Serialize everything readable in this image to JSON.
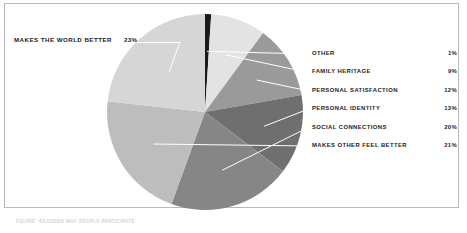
{
  "chart_data": {
    "type": "pie",
    "title": "",
    "categories": [
      "OTHER",
      "FAMILY HERITAGE",
      "PERSONAL SATISFACTION",
      "PERSONAL IDENTITY",
      "SOCIAL CONNECTIONS",
      "MAKES OTHER FEEL BETTER",
      "MAKES THE WORLD BETTER"
    ],
    "values": [
      1,
      9,
      12,
      13,
      20,
      21,
      23
    ],
    "value_labels": [
      "1%",
      "9%",
      "12%",
      "13%",
      "20%",
      "21%",
      "23%"
    ],
    "colors": [
      "#1a1a1a",
      "#e3e3e3",
      "#9a9a9a",
      "#6f6f6f",
      "#868686",
      "#bdbdbd",
      "#d6d6d6"
    ],
    "start_angle_deg": 0,
    "direction": "clockwise",
    "legend_position": "right",
    "grid": false,
    "leader_line_color": "#ffffff"
  },
  "slices": [
    {
      "label": "OTHER",
      "value": "1%",
      "color": "#1a1a1a"
    },
    {
      "label": "FAMILY HERITAGE",
      "value": "9%",
      "color": "#e3e3e3"
    },
    {
      "label": "PERSONAL SATISFACTION",
      "value": "12%",
      "color": "#9a9a9a"
    },
    {
      "label": "PERSONAL IDENTITY",
      "value": "13%",
      "color": "#6f6f6f"
    },
    {
      "label": "SOCIAL CONNECTIONS",
      "value": "20%",
      "color": "#868686"
    },
    {
      "label": "MAKES OTHER FEEL BETTER",
      "value": "21%",
      "color": "#bdbdbd"
    },
    {
      "label": "MAKES THE WORLD BETTER",
      "value": "23%",
      "color": "#d6d6d6"
    }
  ],
  "callout": {
    "label": "MAKES THE WORLD BETTER",
    "value": "23%"
  },
  "legend": {
    "rows": [
      {
        "label": "OTHER",
        "value": "1%"
      },
      {
        "label": "FAMILY HERITAGE",
        "value": "9%"
      },
      {
        "label": "PERSONAL SATISFACTION",
        "value": "12%"
      },
      {
        "label": "PERSONAL IDENTITY",
        "value": "13%"
      },
      {
        "label": "SOCIAL CONNECTIONS",
        "value": "20%"
      },
      {
        "label": "MAKES OTHER FEEL BETTER",
        "value": "21%"
      }
    ]
  },
  "caption": {
    "text": "FIGURE: REASONS WHY PEOPLE PARTICIPATE"
  },
  "colors": {
    "frame_border": "#b9b9b9",
    "background": "#ffffff",
    "text": "#1c1c1c",
    "leader": "#ffffff"
  }
}
